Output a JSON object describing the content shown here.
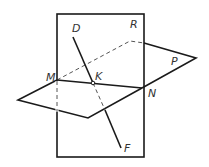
{
  "diagram": {
    "type": "geometry-intersecting-planes",
    "stroke_color": "#1a1a1a",
    "background": "#ffffff",
    "labels": {
      "D": "D",
      "R": "R",
      "M": "M",
      "K": "K",
      "N": "N",
      "P": "P",
      "F": "F"
    },
    "planes": [
      {
        "name": "R",
        "shape": "rectangle"
      },
      {
        "name": "P",
        "shape": "parallelogram"
      }
    ],
    "line": {
      "name": "DF",
      "passes_through": "K"
    },
    "intersection_line": "MN"
  }
}
